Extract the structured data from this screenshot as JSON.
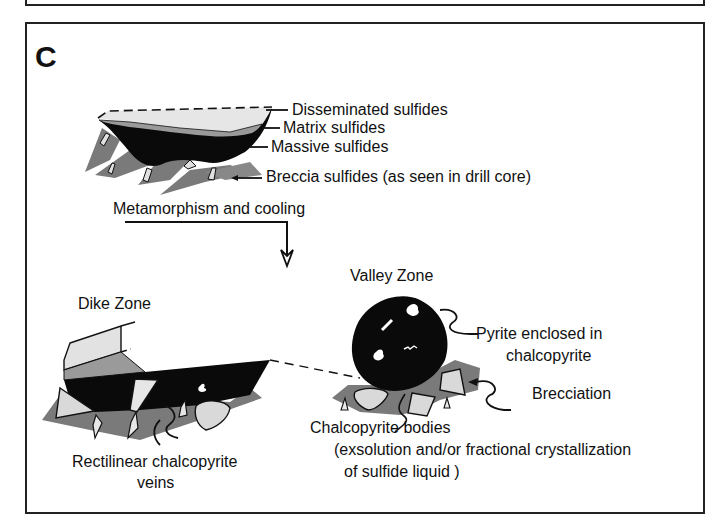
{
  "figure": {
    "panel_letter": "C",
    "stage1": {
      "labels": {
        "disseminated": "Disseminated sulfides",
        "matrix": "Matrix sulfides",
        "massive": "Massive sulfides",
        "breccia": "Breccia sulfides (as seen in drill core)"
      }
    },
    "transition": {
      "label": "Metamorphism and cooling"
    },
    "dike_zone": {
      "title": "Dike Zone",
      "caption_line1": "Rectilinear chalcopyrite",
      "caption_line2": "veins"
    },
    "valley_zone": {
      "title": "Valley Zone",
      "pyrite_line1": "Pyrite enclosed in",
      "pyrite_line2": "chalcopyrite",
      "brecciation": "Brecciation",
      "bodies_line1": "Chalcopyrite bodies",
      "bodies_line2": "(exsolution and/or fractional crystallization",
      "bodies_line3": "of sulfide liquid )"
    },
    "colors": {
      "massive": "#0a0a0a",
      "matrix": "#9a9a9a",
      "breccia_matrix": "#7a7a7a",
      "clast": "#d9d9d9",
      "disseminated": "#e6e6e6",
      "border": "#222222"
    }
  }
}
